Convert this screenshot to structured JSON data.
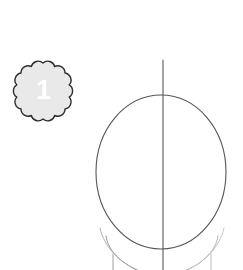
{
  "illustration": {
    "title": "Head construction guide - step 1",
    "subject": "face drawing tutorial",
    "background_color": "#ffffff",
    "line_color": "#5a5a5a",
    "line_color_light": "#a8a8a8"
  },
  "step_badge": {
    "label": "1",
    "shape": "scalloped-circle",
    "lobes": 12,
    "fill_color": "#e9e9e9",
    "stroke_color": "#2b2b2b",
    "text_color": "#ffffff",
    "center_x": 43,
    "center_y": 90,
    "radius": 27
  },
  "shapes": {
    "head_oval": {
      "name": "head-oval",
      "center_x": 161,
      "center_y": 172,
      "radius_x": 65,
      "radius_y": 77,
      "stroke": "#555555",
      "stroke_width": 1
    },
    "center_line": {
      "name": "vertical-center-line",
      "x": 163,
      "y_start": 60,
      "y_end": 270,
      "stroke": "#555555",
      "stroke_width": 1
    },
    "jaw_left": {
      "name": "jaw-guide-left",
      "stroke": "#9a9a9a",
      "stroke_width": 1
    },
    "jaw_right": {
      "name": "jaw-guide-right",
      "stroke": "#b0b0b0",
      "stroke_width": 1
    },
    "neck_left": {
      "name": "neck-line-left",
      "x": 112,
      "y_start": 252,
      "y_end": 270,
      "stroke": "#9a9a9a"
    },
    "neck_right": {
      "name": "neck-line-right",
      "x": 212,
      "y_start": 252,
      "y_end": 270,
      "stroke": "#b0b0b0"
    }
  }
}
